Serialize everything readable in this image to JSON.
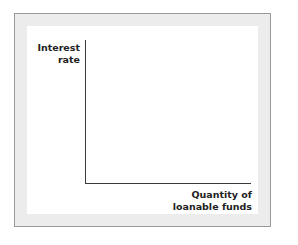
{
  "chart_data": {
    "type": "line",
    "title": "",
    "xlabel": "Quantity of loanable funds",
    "ylabel": "Interest rate",
    "series": [],
    "grid": false
  },
  "diagram": {
    "ylabel_line1": "Interest",
    "ylabel_line2": "rate",
    "xlabel_line1": "Quantity of",
    "xlabel_line2": "loanable funds"
  }
}
